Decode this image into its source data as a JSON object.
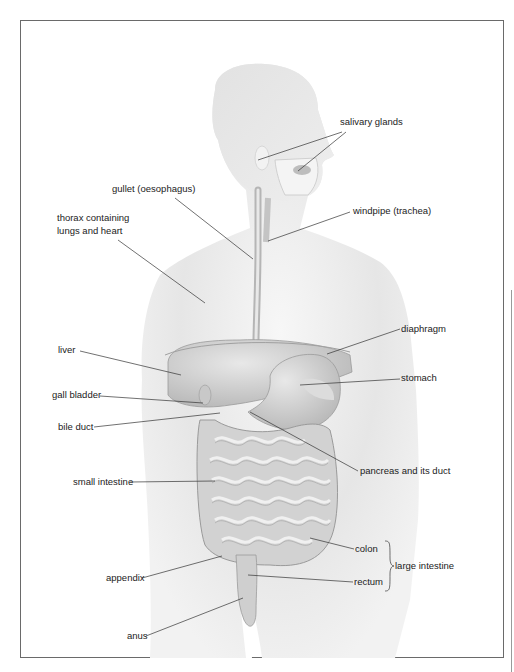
{
  "figure": {
    "labels": {
      "salivary_glands": "salivary glands",
      "gullet": "gullet (oesophagus)",
      "windpipe": "windpipe (trachea)",
      "thorax_line1": "thorax containing",
      "thorax_line2": "lungs and heart",
      "diaphragm": "diaphragm",
      "liver": "liver",
      "stomach": "stomach",
      "gall_bladder": "gall bladder",
      "bile_duct": "bile duct",
      "pancreas": "pancreas and its duct",
      "small_intestine": "small intestine",
      "colon": "colon",
      "large_intestine": "large intestine",
      "appendix": "appendix",
      "rectum": "rectum",
      "anus": "anus"
    }
  }
}
